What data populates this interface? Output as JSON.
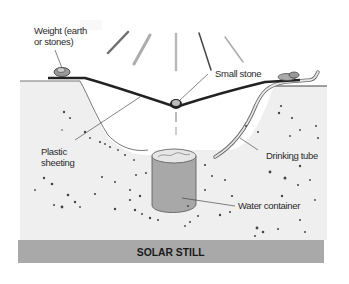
{
  "title": "SOLAR STILL",
  "labels": {
    "weight_line1": "Weight (earth",
    "weight_line2": "or stones)",
    "small_stone": "Small stone",
    "plastic_line1": "Plastic",
    "plastic_line2": "sheeting",
    "drinking_tube": "Drinking tube",
    "water_container": "Water container"
  },
  "colors": {
    "ground": "#efefef",
    "banner": "#a9a9a9",
    "container": "#a8a8a8",
    "sheeting": "#222222"
  }
}
